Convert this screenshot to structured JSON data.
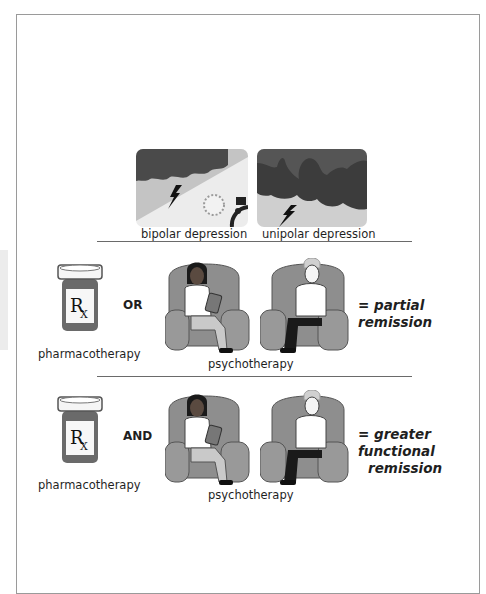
{
  "diagram": {
    "depression_types": [
      {
        "label": "bipolar depression",
        "icon": "storm-and-sun-icon"
      },
      {
        "label": "unipolar depression",
        "icon": "storm-cloud-icon"
      }
    ],
    "rows": [
      {
        "pharma_label": "pharmacotherapy",
        "rx_symbol": "R",
        "rx_sub": "X",
        "operator": "OR",
        "psycho_label": "psychotherapy",
        "result": [
          "= partial remission"
        ]
      },
      {
        "pharma_label": "pharmacotherapy",
        "rx_symbol": "R",
        "rx_sub": "X",
        "operator": "AND",
        "psycho_label": "psychotherapy",
        "result": [
          "= greater functional",
          "remission"
        ]
      }
    ]
  },
  "colors": {
    "cloud_dark": "#4a4a4a",
    "sky_light": "#cfcfcf",
    "chair": "#8e8e8e",
    "bottle": "#6a6a6a",
    "divider": "#6a6a6a",
    "frame": "#9a9a9a"
  }
}
